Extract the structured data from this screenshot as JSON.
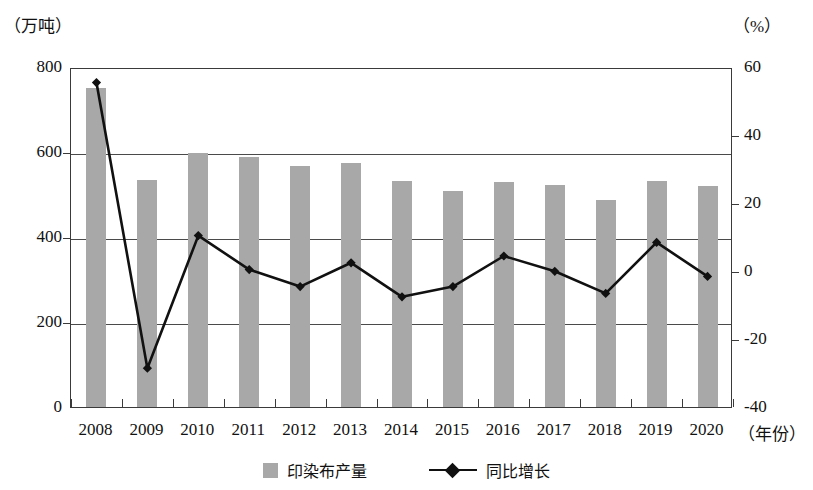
{
  "axes": {
    "left_unit": "（万吨）",
    "right_unit": "（%）",
    "x_unit": "（年份）",
    "left_ticks": [
      "800",
      "600",
      "400",
      "200",
      "0"
    ],
    "right_ticks": [
      "60",
      "40",
      "20",
      "0",
      "-20",
      "-40"
    ]
  },
  "legend": {
    "bar_label": "印染布产量",
    "line_label": "同比增长"
  },
  "colors": {
    "bar_fill": "#a8a8a8",
    "line_stroke": "#111111",
    "axis": "#3a3a3a",
    "grid": "#4a4a4a",
    "background": "#ffffff"
  },
  "chart_data": {
    "type": "bar",
    "title": "",
    "subtitle": "",
    "xlabel": "（年份）",
    "ylabel": "（万吨）",
    "y2label": "（%）",
    "ylim": [
      0,
      800
    ],
    "y2lim": [
      -40,
      60
    ],
    "yticks": [
      0,
      200,
      400,
      600,
      800
    ],
    "y2ticks": [
      -40,
      -20,
      0,
      20,
      40,
      60
    ],
    "grid": true,
    "legend_position": "bottom",
    "categories": [
      "2008",
      "2009",
      "2010",
      "2011",
      "2012",
      "2013",
      "2014",
      "2015",
      "2016",
      "2017",
      "2018",
      "2019",
      "2020"
    ],
    "series": [
      {
        "name": "印染布产量",
        "type": "bar",
        "axis": "left",
        "unit": "万吨",
        "values": [
          750,
          535,
          598,
          588,
          568,
          575,
          532,
          508,
          530,
          522,
          488,
          532,
          520
        ]
      },
      {
        "name": "同比增长",
        "type": "line",
        "axis": "right",
        "unit": "%",
        "marker": "diamond",
        "values": [
          56,
          -28,
          11,
          1,
          -4,
          3,
          -7,
          -4,
          5,
          0.5,
          -6,
          9,
          -1
        ]
      }
    ]
  }
}
